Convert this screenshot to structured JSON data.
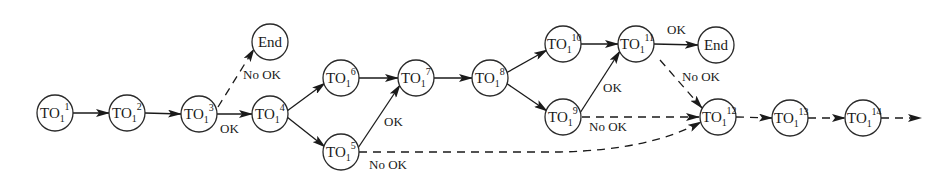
{
  "diagram": {
    "type": "flow-graph",
    "colors": {
      "stroke": "#1a1a1a",
      "fill": "#ffffff",
      "text": "#1a1a1a"
    },
    "nodes": [
      {
        "id": "n1",
        "base": "TO",
        "sub": "1",
        "sup": "1",
        "x": 55,
        "y": 113
      },
      {
        "id": "n2",
        "base": "TO",
        "sub": "1",
        "sup": "2",
        "x": 127,
        "y": 113
      },
      {
        "id": "n3",
        "base": "TO",
        "sub": "1",
        "sup": "3",
        "x": 199,
        "y": 114
      },
      {
        "id": "end1",
        "label": "End",
        "x": 270,
        "y": 42
      },
      {
        "id": "n4",
        "base": "TO",
        "sub": "1",
        "sup": "4",
        "x": 270,
        "y": 114
      },
      {
        "id": "n6",
        "base": "TO",
        "sub": "1",
        "sup": "6",
        "x": 341,
        "y": 78
      },
      {
        "id": "n5",
        "base": "TO",
        "sub": "1",
        "sup": "5",
        "x": 341,
        "y": 152
      },
      {
        "id": "n7",
        "base": "TO",
        "sub": "1",
        "sup": "7",
        "x": 416,
        "y": 78
      },
      {
        "id": "n8",
        "base": "TO",
        "sub": "1",
        "sup": "8",
        "x": 490,
        "y": 78
      },
      {
        "id": "n10",
        "base": "TO",
        "sub": "1",
        "sup": "10",
        "x": 563,
        "y": 44
      },
      {
        "id": "n9",
        "base": "TO",
        "sub": "1",
        "sup": "9",
        "x": 563,
        "y": 117
      },
      {
        "id": "n11",
        "base": "TO",
        "sub": "1",
        "sup": "11",
        "x": 636,
        "y": 44
      },
      {
        "id": "end2",
        "label": "End",
        "x": 716,
        "y": 45
      },
      {
        "id": "n12",
        "base": "TO",
        "sub": "1",
        "sup": "12",
        "x": 718,
        "y": 117
      },
      {
        "id": "n13",
        "base": "TO",
        "sub": "1",
        "sup": "13",
        "x": 790,
        "y": 118
      },
      {
        "id": "n14",
        "base": "TO",
        "sub": "1",
        "sup": "14",
        "x": 863,
        "y": 118
      }
    ],
    "edges": [
      {
        "from": "n1",
        "to": "n2",
        "style": "solid"
      },
      {
        "from": "n2",
        "to": "n3",
        "style": "solid"
      },
      {
        "from": "n3",
        "to": "n4",
        "style": "solid",
        "label": "OK"
      },
      {
        "from": "n3",
        "to": "end1",
        "style": "dashed",
        "label": "No OK"
      },
      {
        "from": "n4",
        "to": "n6",
        "style": "solid"
      },
      {
        "from": "n4",
        "to": "n5",
        "style": "solid"
      },
      {
        "from": "n6",
        "to": "n7",
        "style": "solid"
      },
      {
        "from": "n5",
        "to": "n7",
        "style": "solid",
        "label": "OK"
      },
      {
        "from": "n5",
        "to": "n12",
        "style": "dashed",
        "label": "No OK"
      },
      {
        "from": "n7",
        "to": "n8",
        "style": "solid"
      },
      {
        "from": "n8",
        "to": "n10",
        "style": "solid"
      },
      {
        "from": "n8",
        "to": "n9",
        "style": "solid"
      },
      {
        "from": "n10",
        "to": "n11",
        "style": "solid"
      },
      {
        "from": "n9",
        "to": "n11",
        "style": "solid",
        "label": "OK"
      },
      {
        "from": "n9",
        "to": "n12",
        "style": "dashed",
        "label": "No OK"
      },
      {
        "from": "n11",
        "to": "end2",
        "style": "solid",
        "label": "OK"
      },
      {
        "from": "n11",
        "to": "n12",
        "style": "dashed",
        "label": "No OK"
      },
      {
        "from": "n12",
        "to": "n13",
        "style": "dashed"
      },
      {
        "from": "n13",
        "to": "n14",
        "style": "dashed"
      },
      {
        "from": "n14",
        "to": "out",
        "style": "dashed"
      }
    ],
    "edge_labels": {
      "ok_3_4": "OK",
      "nook_3_end": "No OK",
      "ok_5_7": "OK",
      "nook_5_12": "No OK",
      "ok_9_11": "OK",
      "nook_9_12": "No OK",
      "ok_11_end": "OK",
      "nook_11_12": "No OK"
    }
  }
}
